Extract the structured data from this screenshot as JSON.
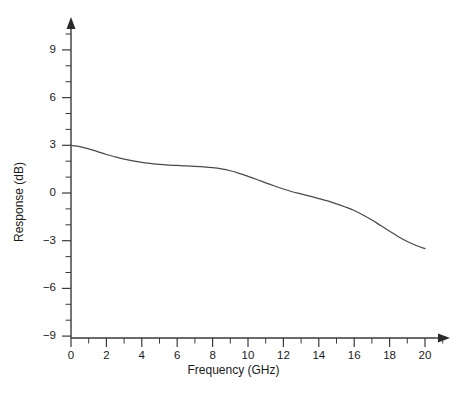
{
  "chart_data": {
    "type": "line",
    "title": "",
    "xlabel": "Frequency (GHz)",
    "ylabel": "Response (dB)",
    "xlim": [
      0,
      21.5
    ],
    "ylim": [
      -9,
      10
    ],
    "grid": false,
    "legend": null,
    "x_major_ticks": [
      0,
      2,
      4,
      6,
      8,
      10,
      12,
      14,
      16,
      18,
      20
    ],
    "x_major_tick_labels": [
      "0",
      "2",
      "4",
      "6",
      "8",
      "10",
      "12",
      "14",
      "16",
      "18",
      "20"
    ],
    "x_minor_ticks": [
      1,
      3,
      5,
      7,
      9,
      11,
      13,
      15,
      17,
      19,
      21
    ],
    "y_major_ticks": [
      -9,
      -6,
      -3,
      0,
      3,
      6,
      9
    ],
    "y_major_tick_labels": [
      "−9",
      "−6",
      "−3",
      "0",
      "3",
      "6",
      "9"
    ],
    "y_minor_ticks": [
      -8,
      -7,
      -5,
      -4,
      -2,
      -1,
      1,
      2,
      4,
      5,
      7,
      8,
      10
    ],
    "series": [
      {
        "name": "Response",
        "x": [
          0,
          0.5,
          1,
          1.5,
          2,
          2.5,
          3,
          3.5,
          4,
          4.5,
          5,
          5.5,
          6,
          6.5,
          7,
          7.5,
          8,
          8.5,
          9,
          9.5,
          10,
          10.5,
          11,
          11.5,
          12,
          12.5,
          13,
          13.5,
          14,
          14.5,
          15,
          15.5,
          16,
          16.5,
          17,
          17.5,
          18,
          18.5,
          19,
          19.5,
          20
        ],
        "values": [
          3.0,
          2.92,
          2.78,
          2.6,
          2.42,
          2.27,
          2.13,
          2.02,
          1.93,
          1.86,
          1.8,
          1.76,
          1.73,
          1.7,
          1.68,
          1.65,
          1.6,
          1.52,
          1.4,
          1.24,
          1.05,
          0.85,
          0.64,
          0.44,
          0.25,
          0.08,
          -0.06,
          -0.2,
          -0.35,
          -0.5,
          -0.68,
          -0.88,
          -1.1,
          -1.38,
          -1.7,
          -2.05,
          -2.4,
          -2.75,
          -3.05,
          -3.3,
          -3.5
        ]
      }
    ],
    "colors": {
      "curve": "#4a4a4a",
      "axis": "#3a3a3a",
      "background": "#ffffff",
      "text": "#1a1a1a"
    }
  }
}
